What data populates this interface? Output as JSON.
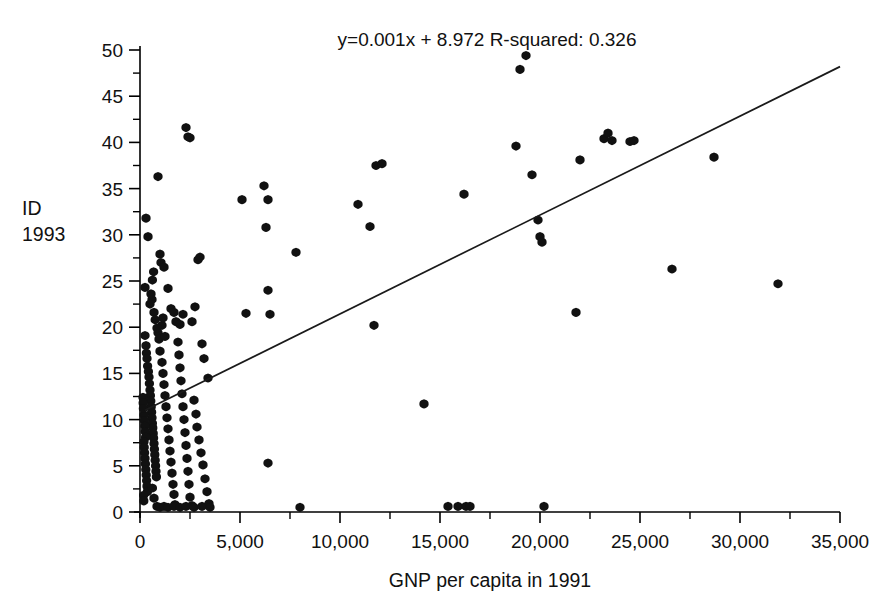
{
  "figure": {
    "annotation": "y=0.001x + 8.972   R-squared: 0.326",
    "equation": "y=0.001x + 8.972",
    "r_squared_label": "R-squared: 0.326",
    "ylabel_line1": "ID",
    "ylabel_line2": "1993",
    "xlabel": "GNP per capita in 1991",
    "marker_color": "#111111",
    "line_color": "#1a1a1a",
    "axis_color": "#000000",
    "background": "#ffffff"
  },
  "chart_data": {
    "type": "scatter",
    "title": "",
    "xlabel": "GNP per capita in 1991",
    "ylabel": "ID 1993",
    "xlim": [
      0,
      35000
    ],
    "ylim": [
      0,
      50
    ],
    "grid": false,
    "legend": null,
    "xticks": [
      0,
      5000,
      10000,
      15000,
      20000,
      25000,
      30000,
      35000
    ],
    "xtick_labels": [
      "0",
      "5,000",
      "10,000",
      "15,000",
      "20,000",
      "25,000",
      "30,000",
      "35,000"
    ],
    "yticks": [
      0,
      5,
      10,
      15,
      20,
      25,
      30,
      35,
      40,
      45,
      50
    ],
    "ytick_labels": [
      "0",
      "5",
      "10",
      "15",
      "20",
      "25",
      "30",
      "35",
      "40",
      "45",
      "50"
    ],
    "x_minor_step": 2500,
    "y_minor_step": 2.5,
    "annotations": [
      "y=0.001x + 8.972   R-squared: 0.326"
    ],
    "fit": {
      "type": "linear",
      "slope": 0.001,
      "intercept": 8.972,
      "r_squared": 0.326,
      "equation": "y=0.001x + 8.972",
      "draw_from_x": 250,
      "draw_to_x": 35000,
      "draw_from_y": 11.0,
      "draw_to_y": 48.2
    },
    "points": [
      [
        300,
        31.8
      ],
      [
        400,
        29.8
      ],
      [
        250,
        24.3
      ],
      [
        600,
        23.0
      ],
      [
        700,
        21.6
      ],
      [
        900,
        36.3
      ],
      [
        1000,
        27.9
      ],
      [
        1050,
        27.0
      ],
      [
        1200,
        26.5
      ],
      [
        1400,
        24.2
      ],
      [
        1550,
        22.0
      ],
      [
        1700,
        21.6
      ],
      [
        1800,
        20.6
      ],
      [
        2000,
        20.3
      ],
      [
        2150,
        21.4
      ],
      [
        2300,
        41.6
      ],
      [
        2400,
        40.6
      ],
      [
        2500,
        40.5
      ],
      [
        2600,
        20.6
      ],
      [
        2750,
        22.2
      ],
      [
        2900,
        27.3
      ],
      [
        3000,
        27.6
      ],
      [
        3100,
        18.2
      ],
      [
        3200,
        16.6
      ],
      [
        3400,
        14.5
      ],
      [
        250,
        19.1
      ],
      [
        300,
        18.0
      ],
      [
        320,
        17.2
      ],
      [
        350,
        16.6
      ],
      [
        380,
        15.8
      ],
      [
        420,
        15.2
      ],
      [
        450,
        14.6
      ],
      [
        470,
        13.9
      ],
      [
        500,
        13.2
      ],
      [
        520,
        12.6
      ],
      [
        540,
        12.0
      ],
      [
        560,
        11.4
      ],
      [
        580,
        10.8
      ],
      [
        600,
        10.2
      ],
      [
        620,
        9.6
      ],
      [
        640,
        9.1
      ],
      [
        660,
        8.5
      ],
      [
        680,
        8.0
      ],
      [
        700,
        7.4
      ],
      [
        720,
        6.8
      ],
      [
        740,
        6.2
      ],
      [
        760,
        5.6
      ],
      [
        780,
        5.0
      ],
      [
        800,
        4.4
      ],
      [
        820,
        3.8
      ],
      [
        200,
        10.5
      ],
      [
        220,
        9.9
      ],
      [
        240,
        9.3
      ],
      [
        260,
        8.7
      ],
      [
        280,
        8.1
      ],
      [
        200,
        7.6
      ],
      [
        210,
        7.0
      ],
      [
        230,
        6.4
      ],
      [
        250,
        5.8
      ],
      [
        270,
        5.2
      ],
      [
        290,
        4.6
      ],
      [
        310,
        4.0
      ],
      [
        330,
        3.4
      ],
      [
        350,
        2.8
      ],
      [
        370,
        2.2
      ],
      [
        150,
        12.4
      ],
      [
        160,
        11.8
      ],
      [
        170,
        11.2
      ],
      [
        180,
        1.8
      ],
      [
        190,
        1.2
      ],
      [
        900,
        19.4
      ],
      [
        950,
        18.7
      ],
      [
        1000,
        17.4
      ],
      [
        1100,
        16.2
      ],
      [
        1150,
        15.0
      ],
      [
        1200,
        13.8
      ],
      [
        1250,
        12.6
      ],
      [
        1300,
        11.4
      ],
      [
        1350,
        10.2
      ],
      [
        1400,
        9.0
      ],
      [
        1450,
        7.8
      ],
      [
        1500,
        6.6
      ],
      [
        1550,
        5.4
      ],
      [
        1600,
        4.2
      ],
      [
        1650,
        3.0
      ],
      [
        1700,
        1.9
      ],
      [
        1750,
        0.8
      ],
      [
        1100,
        20.2
      ],
      [
        1150,
        21.0
      ],
      [
        1250,
        19.0
      ],
      [
        1900,
        18.4
      ],
      [
        1950,
        17.0
      ],
      [
        2000,
        15.6
      ],
      [
        2050,
        14.2
      ],
      [
        2100,
        12.8
      ],
      [
        2150,
        11.4
      ],
      [
        2200,
        10.0
      ],
      [
        2250,
        8.6
      ],
      [
        2300,
        7.2
      ],
      [
        2350,
        5.8
      ],
      [
        2400,
        4.4
      ],
      [
        2450,
        3.0
      ],
      [
        2500,
        1.6
      ],
      [
        2600,
        0.7
      ],
      [
        2700,
        12.1
      ],
      [
        2800,
        10.6
      ],
      [
        2850,
        9.2
      ],
      [
        2950,
        7.8
      ],
      [
        3050,
        6.4
      ],
      [
        3150,
        5.1
      ],
      [
        3250,
        3.6
      ],
      [
        3350,
        2.2
      ],
      [
        3450,
        0.9
      ],
      [
        500,
        22.5
      ],
      [
        550,
        23.6
      ],
      [
        620,
        25.1
      ],
      [
        680,
        26.0
      ],
      [
        760,
        20.8
      ],
      [
        850,
        19.9
      ],
      [
        620,
        2.6
      ],
      [
        700,
        1.5
      ],
      [
        850,
        0.6
      ],
      [
        1000,
        0.5
      ],
      [
        1200,
        0.6
      ],
      [
        1400,
        0.5
      ],
      [
        1700,
        0.6
      ],
      [
        2000,
        0.5
      ],
      [
        2300,
        0.6
      ],
      [
        2700,
        0.5
      ],
      [
        3100,
        0.6
      ],
      [
        3500,
        0.5
      ],
      [
        5100,
        33.8
      ],
      [
        5300,
        21.5
      ],
      [
        6200,
        35.3
      ],
      [
        6400,
        33.8
      ],
      [
        6300,
        30.8
      ],
      [
        6400,
        24.0
      ],
      [
        6500,
        21.4
      ],
      [
        6400,
        5.3
      ],
      [
        7800,
        28.1
      ],
      [
        8000,
        0.5
      ],
      [
        10900,
        33.3
      ],
      [
        11500,
        30.9
      ],
      [
        11800,
        37.5
      ],
      [
        12100,
        37.7
      ],
      [
        11700,
        20.2
      ],
      [
        14200,
        11.7
      ],
      [
        15400,
        0.6
      ],
      [
        15900,
        0.6
      ],
      [
        16200,
        34.4
      ],
      [
        16300,
        0.6
      ],
      [
        16500,
        0.6
      ],
      [
        18800,
        39.6
      ],
      [
        19000,
        47.9
      ],
      [
        19300,
        49.4
      ],
      [
        19600,
        36.5
      ],
      [
        19900,
        31.6
      ],
      [
        20000,
        29.8
      ],
      [
        20100,
        29.2
      ],
      [
        20200,
        0.6
      ],
      [
        21800,
        21.6
      ],
      [
        22000,
        38.1
      ],
      [
        23200,
        40.4
      ],
      [
        23400,
        41.0
      ],
      [
        23600,
        40.2
      ],
      [
        24500,
        40.1
      ],
      [
        24700,
        40.2
      ],
      [
        26600,
        26.3
      ],
      [
        28700,
        38.4
      ],
      [
        31900,
        24.7
      ]
    ]
  }
}
